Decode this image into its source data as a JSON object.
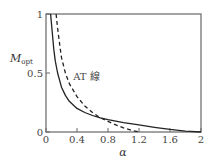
{
  "chart_data": {
    "type": "line",
    "title": "",
    "xlabel": "α",
    "ylabel": "M",
    "ylabel_sub": "opt",
    "xlim": [
      0,
      2
    ],
    "ylim": [
      0,
      1
    ],
    "xticks": [
      0,
      0.4,
      0.8,
      1.2,
      1.6,
      2
    ],
    "xtick_labels": [
      "0",
      "0.4",
      "0.8",
      "1.2",
      "1.6",
      "2"
    ],
    "yticks": [
      0,
      0.5,
      1
    ],
    "ytick_labels": [
      "0",
      "0.5",
      "1"
    ],
    "grid": false,
    "legend": "none",
    "annotations": [
      {
        "text": "AT 線",
        "x": 0.35,
        "y": 0.44,
        "refers_to": "dashed"
      }
    ],
    "series": [
      {
        "name": "M_opt",
        "style": "solid",
        "x": [
          0.06,
          0.08,
          0.1,
          0.12,
          0.15,
          0.2,
          0.25,
          0.3,
          0.4,
          0.5,
          0.6,
          0.7,
          0.8,
          1.0,
          1.2,
          1.4,
          1.6,
          1.8,
          2.0
        ],
        "y": [
          1.0,
          0.85,
          0.7,
          0.6,
          0.5,
          0.38,
          0.31,
          0.26,
          0.2,
          0.165,
          0.14,
          0.12,
          0.105,
          0.08,
          0.06,
          0.04,
          0.022,
          0.008,
          0.0
        ]
      },
      {
        "name": "AT 線",
        "style": "dashed",
        "x": [
          0.13,
          0.15,
          0.18,
          0.2,
          0.25,
          0.3,
          0.4,
          0.5,
          0.6,
          0.7,
          0.8,
          0.9,
          1.0,
          1.1,
          1.2
        ],
        "y": [
          1.0,
          0.88,
          0.72,
          0.63,
          0.5,
          0.41,
          0.3,
          0.22,
          0.165,
          0.12,
          0.09,
          0.06,
          0.035,
          0.015,
          0.0
        ]
      }
    ]
  }
}
